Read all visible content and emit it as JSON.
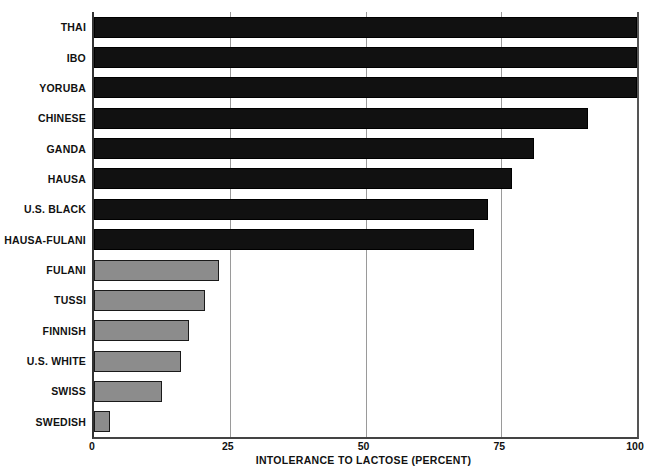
{
  "chart_data": {
    "type": "bar",
    "orientation": "horizontal",
    "title": "",
    "xlabel": "INTOLERANCE TO LACTOSE (PERCENT)",
    "ylabel": "",
    "xlim": [
      0,
      100
    ],
    "xticks": [
      0,
      25,
      50,
      75,
      100
    ],
    "xtick_labels": [
      "0",
      "25",
      "50",
      "75",
      "100"
    ],
    "grid": "vertical gridlines at 25, 50, 75",
    "legend": "none",
    "categories": [
      "THAI",
      "IBO",
      "YORUBA",
      "CHINESE",
      "GANDA",
      "HAUSA",
      "U.S. BLACK",
      "HAUSA-FULANI",
      "FULANI",
      "TUSSI",
      "FINNISH",
      "U.S. WHITE",
      "SWISS",
      "SWEDISH"
    ],
    "values": [
      100,
      100,
      100,
      91,
      81,
      77,
      72.5,
      70,
      23,
      20.5,
      17.5,
      16,
      12.5,
      3
    ],
    "bar_styles": [
      "dark",
      "dark",
      "dark",
      "dark",
      "dark",
      "dark",
      "dark",
      "dark",
      "light",
      "light",
      "light",
      "light",
      "light",
      "light"
    ],
    "colors": {
      "dark_bar": "#111111",
      "light_bar": "#8c8c8c",
      "bar_outline": "#000000",
      "axis": "#333333",
      "gridline": "#9a9a9a",
      "background": "#ffffff",
      "text": "#111111"
    }
  }
}
